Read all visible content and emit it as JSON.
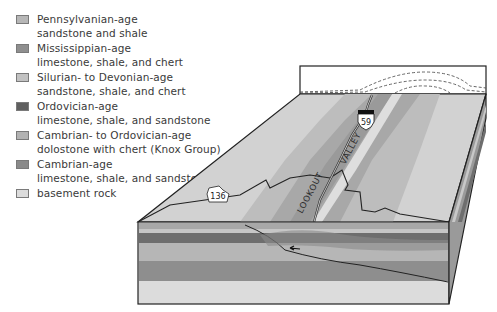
{
  "legend": {
    "items": [
      {
        "line1": "Pennsylvanian-age",
        "line2": "sandstone and shale",
        "color": "#b7b7b7"
      },
      {
        "line1": "Mississippian-age",
        "line2": "limestone, shale, and chert",
        "color": "#8f8f8f"
      },
      {
        "line1": "Silurian- to Devonian-age",
        "line2": "sandstone, shale, and chert",
        "color": "#c2c2c2"
      },
      {
        "line1": "Ordovician-age",
        "line2": "limestone, shale, and sandstone",
        "color": "#5f5f5f"
      },
      {
        "line1": "Cambrian- to Ordovician-age",
        "line2": "dolostone with chert (Knox Group)",
        "color": "#b2b2b2"
      },
      {
        "line1": "Cambrian-age",
        "line2": "limestone, shale, and sandstone",
        "color": "#8a8a8a"
      },
      {
        "line1": "basement rock",
        "line2": "",
        "color": "#dcdcdc"
      }
    ]
  },
  "diagram": {
    "valley_label_1": "LOOKOUT",
    "valley_label_2": "VALLEY",
    "highway_shield_us": "59",
    "highway_shield_state": "136"
  }
}
